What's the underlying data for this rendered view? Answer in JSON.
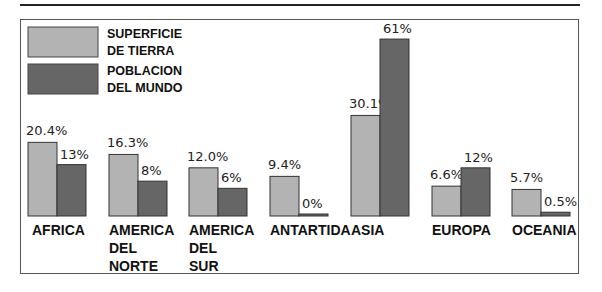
{
  "chart_data": {
    "type": "bar",
    "title": "",
    "xlabel": "",
    "ylabel": "",
    "categories": [
      [
        "AFRICA"
      ],
      [
        "AMERICA",
        "DEL",
        "NORTE"
      ],
      [
        "AMERICA",
        "DEL",
        "SUR"
      ],
      [
        "ANTARTIDA"
      ],
      [
        "ASIA"
      ],
      [
        "EUROPA"
      ],
      [
        "OCEANIA"
      ]
    ],
    "series": [
      {
        "name": "SUPERFICIE DE TIERRA",
        "legend_lines": [
          "SUPERFICIE",
          "DE TIERRA"
        ],
        "color": "#b3b3b3",
        "values": [
          20.4,
          16.3,
          12.0,
          9.4,
          30.1,
          6.6,
          5.7
        ],
        "labels": [
          "20.4%",
          "16.3%",
          "12.0%",
          "9.4%",
          "30.1%",
          "6.6%",
          "5.7%"
        ]
      },
      {
        "name": "POBLACION DEL MUNDO",
        "legend_lines": [
          "POBLACION",
          "DEL MUNDO"
        ],
        "color": "#666666",
        "values": [
          13,
          8,
          6,
          0,
          61,
          12,
          0.5
        ],
        "labels": [
          "13%",
          "8%",
          "6%",
          "0%",
          "61%",
          "12%",
          "0.5%"
        ]
      }
    ],
    "legend": "top-left",
    "grid": false,
    "axes_visible": false,
    "ylim": [
      0,
      61
    ]
  }
}
